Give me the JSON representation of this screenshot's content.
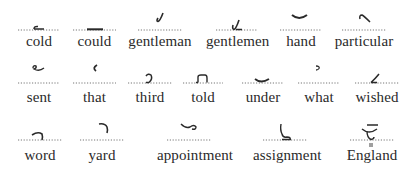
{
  "rows": [
    {
      "items": [
        {
          "word": "cold",
          "outline": "dash-hook-left"
        },
        {
          "word": "could",
          "outline": "thick-dash"
        },
        {
          "word": "gentleman",
          "outline": "j-hook-above"
        },
        {
          "word": "gentlemen",
          "outline": "j-hook-on-line"
        },
        {
          "word": "hand",
          "outline": "shallow-curve-above"
        },
        {
          "word": "particular",
          "outline": "loop-diagonal-above"
        }
      ]
    },
    {
      "items": [
        {
          "word": "sent",
          "outline": "loop-curve-above"
        },
        {
          "word": "that",
          "outline": "small-left-curve-above"
        },
        {
          "word": "third",
          "outline": "reverse-s-on-line"
        },
        {
          "word": "told",
          "outline": "hooked-f-on-line"
        },
        {
          "word": "under",
          "outline": "cup-on-line"
        },
        {
          "word": "what",
          "outline": "small-hook-above"
        },
        {
          "word": "wished",
          "outline": "diagonal-stroke-on-line"
        }
      ]
    },
    {
      "items": [
        {
          "word": "word",
          "outline": "arch-on-line"
        },
        {
          "word": "yard",
          "outline": "arch-above"
        },
        {
          "word": "appointment",
          "outline": "wave-loop-above"
        },
        {
          "word": "assignment",
          "outline": "upright-hook-on-line"
        },
        {
          "word": "England",
          "outline": "cup-with-dots"
        }
      ]
    }
  ],
  "colors": {
    "ink": "#2a2a2a",
    "dots": "#6a6a6a",
    "background": "#ffffff"
  }
}
